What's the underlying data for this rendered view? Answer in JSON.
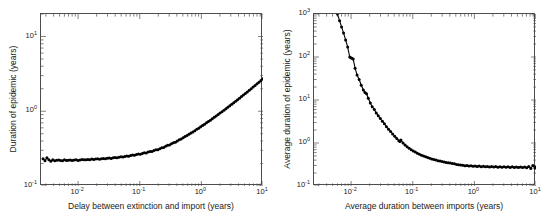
{
  "figure": {
    "background": "#ffffff",
    "line_color": "#000000",
    "axis_color": "#4d4d4d",
    "text_color": "#1a1a1a"
  },
  "panels": [
    {
      "id": "left",
      "name": "duration-of-epidemic-panel",
      "xlabel": "Delay between extinction and import (years)",
      "ylabel": "Duration of epidemic (years)",
      "xticks": [
        {
          "value": 0.01,
          "label": "10",
          "exp": "-2"
        },
        {
          "value": 0.1,
          "label": "10",
          "exp": "-1"
        },
        {
          "value": 1,
          "label": "10",
          "exp": "0"
        },
        {
          "value": 10,
          "label": "10",
          "exp": "1"
        }
      ],
      "yticks": [
        {
          "value": 0.1,
          "label": "10",
          "exp": "-1"
        },
        {
          "value": 1,
          "label": "10",
          "exp": "0"
        },
        {
          "value": 10,
          "label": "10",
          "exp": "1"
        }
      ]
    },
    {
      "id": "right",
      "name": "average-duration-of-epidemic-panel",
      "xlabel": "Average duration between imports (years)",
      "ylabel": "Average duration of epidemic (years)",
      "xticks": [
        {
          "value": 0.01,
          "label": "10",
          "exp": "-2"
        },
        {
          "value": 0.1,
          "label": "10",
          "exp": "-1"
        },
        {
          "value": 1,
          "label": "10",
          "exp": "0"
        },
        {
          "value": 10,
          "label": "10",
          "exp": "1"
        }
      ],
      "yticks": [
        {
          "value": 0.1,
          "label": "10",
          "exp": "-1"
        },
        {
          "value": 1,
          "label": "10",
          "exp": "0"
        },
        {
          "value": 10,
          "label": "10",
          "exp": "1"
        },
        {
          "value": 100,
          "label": "10",
          "exp": "2"
        },
        {
          "value": 1000,
          "label": "10",
          "exp": "3"
        }
      ]
    }
  ],
  "chart_data": [
    {
      "type": "line",
      "id": "left",
      "title": "",
      "xlabel": "Delay between extinction and import (years)",
      "ylabel": "Duration of epidemic (years)",
      "xscale": "log",
      "yscale": "log",
      "xlim": [
        0.0025,
        10
      ],
      "ylim": [
        0.1,
        20
      ],
      "grid": false,
      "legend": null,
      "marker": "filled-circle",
      "x": [
        0.0027,
        0.0029,
        0.00312,
        0.00336,
        0.00361,
        0.00388,
        0.00418,
        0.00449,
        0.00483,
        0.0052,
        0.00559,
        0.00601,
        0.00647,
        0.00695,
        0.00748,
        0.00804,
        0.00865,
        0.0093,
        0.01,
        0.01076,
        0.01157,
        0.01244,
        0.01338,
        0.01439,
        0.01547,
        0.01664,
        0.01789,
        0.01924,
        0.02069,
        0.02225,
        0.02393,
        0.02573,
        0.02767,
        0.02976,
        0.032,
        0.03441,
        0.037,
        0.03979,
        0.04279,
        0.04601,
        0.04948,
        0.05321,
        0.05722,
        0.06153,
        0.06617,
        0.07116,
        0.07652,
        0.08229,
        0.08849,
        0.09516,
        0.10233,
        0.11004,
        0.11833,
        0.12725,
        0.13684,
        0.14715,
        0.15824,
        0.17016,
        0.18299,
        0.19678,
        0.21161,
        0.22756,
        0.24471,
        0.26315,
        0.28298,
        0.30431,
        0.32724,
        0.3519,
        0.37842,
        0.40694,
        0.43761,
        0.47058,
        0.50604,
        0.54417,
        0.58518,
        0.62928,
        0.67671,
        0.7277,
        0.78254,
        0.84151,
        0.90493,
        0.97313,
        1.04646,
        1.12533,
        1.21014,
        1.30134,
        1.39941,
        1.50487,
        1.61827,
        1.74021,
        1.87134,
        2.01234,
        2.16397,
        2.32704,
        2.50241,
        2.69101,
        2.89385,
        3.112,
        3.34661,
        3.59893,
        3.8703,
        4.16213,
        4.47596,
        4.81344,
        5.17631,
        5.56647,
        5.98594,
        6.4369,
        6.92169,
        7.4428,
        8.00293,
        8.60495,
        9.25197,
        9.94734
      ],
      "y": [
        0.231,
        0.218,
        0.238,
        0.224,
        0.215,
        0.224,
        0.217,
        0.221,
        0.223,
        0.219,
        0.218,
        0.224,
        0.22,
        0.221,
        0.223,
        0.219,
        0.223,
        0.225,
        0.22,
        0.223,
        0.226,
        0.224,
        0.225,
        0.227,
        0.224,
        0.229,
        0.227,
        0.229,
        0.231,
        0.228,
        0.232,
        0.234,
        0.231,
        0.235,
        0.237,
        0.234,
        0.239,
        0.241,
        0.239,
        0.243,
        0.246,
        0.244,
        0.249,
        0.252,
        0.25,
        0.256,
        0.259,
        0.257,
        0.264,
        0.268,
        0.266,
        0.273,
        0.278,
        0.276,
        0.284,
        0.29,
        0.289,
        0.298,
        0.305,
        0.306,
        0.316,
        0.325,
        0.328,
        0.339,
        0.35,
        0.354,
        0.367,
        0.379,
        0.386,
        0.401,
        0.416,
        0.426,
        0.443,
        0.46,
        0.473,
        0.492,
        0.512,
        0.528,
        0.55,
        0.573,
        0.593,
        0.619,
        0.645,
        0.67,
        0.7,
        0.73,
        0.76,
        0.795,
        0.83,
        0.865,
        0.906,
        0.946,
        0.988,
        1.035,
        1.082,
        1.132,
        1.187,
        1.242,
        1.301,
        1.363,
        1.429,
        1.498,
        1.571,
        1.648,
        1.729,
        1.815,
        1.906,
        2.003,
        2.105,
        2.213,
        2.328,
        2.45,
        2.58,
        2.72
      ]
    },
    {
      "type": "line",
      "id": "right",
      "title": "",
      "xlabel": "Average duration between imports (years)",
      "ylabel": "Average duration of epidemic (years)",
      "xscale": "log",
      "yscale": "log",
      "xlim": [
        0.0025,
        10
      ],
      "ylim": [
        0.1,
        1000
      ],
      "grid": false,
      "legend": null,
      "marker": "filled-circle",
      "x": [
        0.006,
        0.0065,
        0.007,
        0.00755,
        0.00815,
        0.0088,
        0.0095,
        0.0099,
        0.0103,
        0.0108,
        0.0116,
        0.0125,
        0.0135,
        0.0146,
        0.0158,
        0.0168,
        0.0178,
        0.019,
        0.0205,
        0.022,
        0.0238,
        0.0256,
        0.0276,
        0.0298,
        0.0322,
        0.0347,
        0.0375,
        0.0405,
        0.0437,
        0.0472,
        0.051,
        0.0551,
        0.0595,
        0.062,
        0.0643,
        0.0695,
        0.075,
        0.081,
        0.0875,
        0.0945,
        0.102,
        0.1102,
        0.119,
        0.1285,
        0.1388,
        0.1499,
        0.1619,
        0.1749,
        0.1889,
        0.204,
        0.2203,
        0.238,
        0.257,
        0.2776,
        0.2999,
        0.3239,
        0.3498,
        0.3779,
        0.4081,
        0.4408,
        0.4761,
        0.5142,
        0.5554,
        0.5999,
        0.6479,
        0.6998,
        0.7559,
        0.8164,
        0.8818,
        0.9524,
        1.0287,
        1.1111,
        1.2001,
        1.2962,
        1.3999,
        1.512,
        1.6332,
        1.764,
        1.9053,
        2.0579,
        2.2228,
        2.4009,
        2.5932,
        2.8009,
        3.0252,
        3.2675,
        3.5293,
        3.812,
        4.1173,
        4.4471,
        4.8034,
        5.1882,
        5.6038,
        6.0527,
        6.5376,
        7.0612,
        7.6268,
        8.2377,
        8.8976,
        9.6104,
        9.98
      ],
      "y": [
        1000.0,
        700.0,
        500.0,
        360.0,
        250.0,
        170.0,
        100.0,
        96.0,
        94.0,
        90.0,
        55.0,
        38.0,
        30.0,
        22.0,
        17.0,
        15.0,
        14.0,
        11.0,
        8.5,
        7.0,
        6.0,
        5.0,
        4.3,
        3.7,
        3.2,
        2.8,
        2.4,
        2.1,
        1.85,
        1.62,
        1.44,
        1.28,
        1.13,
        1.08,
        1.18,
        1.0,
        0.9,
        0.82,
        0.76,
        0.7,
        0.655,
        0.615,
        0.58,
        0.549,
        0.522,
        0.498,
        0.477,
        0.458,
        0.441,
        0.426,
        0.412,
        0.4,
        0.389,
        0.379,
        0.37,
        0.362,
        0.354,
        0.347,
        0.341,
        0.335,
        0.33,
        0.318,
        0.312,
        0.308,
        0.305,
        0.297,
        0.3,
        0.292,
        0.296,
        0.288,
        0.292,
        0.284,
        0.29,
        0.281,
        0.287,
        0.279,
        0.286,
        0.277,
        0.284,
        0.276,
        0.283,
        0.274,
        0.282,
        0.273,
        0.281,
        0.272,
        0.28,
        0.271,
        0.279,
        0.27,
        0.278,
        0.269,
        0.277,
        0.268,
        0.276,
        0.267,
        0.285,
        0.255,
        0.3,
        0.262,
        0.272
      ]
    }
  ]
}
